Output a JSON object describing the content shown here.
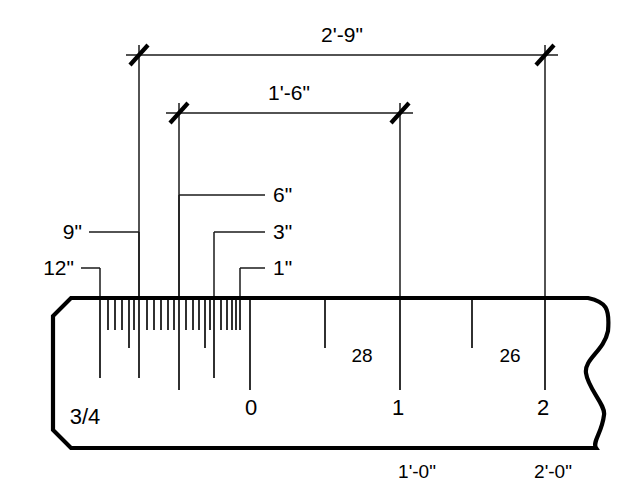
{
  "diagram": {
    "type": "architectural-scale-ruler",
    "scale_designation": "3/4",
    "dimensions": [
      {
        "id": "overall",
        "label": "2'-9\"",
        "x_start": 139,
        "x_end": 545,
        "y": 55,
        "text_x": 342,
        "text_y": 42
      },
      {
        "id": "inner",
        "label": "1'-6\"",
        "x_start": 179,
        "x_end": 400,
        "y": 113,
        "text_x": 289,
        "text_y": 100
      }
    ],
    "leaders": [
      {
        "id": "six-inch",
        "label": "6\"",
        "tick_x": 179,
        "elbow_y": 195,
        "text_x": 273,
        "text_y": 202,
        "side": "right",
        "run_end_x": 265
      },
      {
        "id": "three-inch",
        "label": "3\"",
        "tick_x": 214,
        "elbow_y": 232,
        "text_x": 273,
        "text_y": 239,
        "side": "right",
        "run_end_x": 265
      },
      {
        "id": "one-inch",
        "label": "1\"",
        "tick_x": 240,
        "elbow_y": 268,
        "text_x": 273,
        "text_y": 275,
        "side": "right",
        "run_end_x": 265
      },
      {
        "id": "nine-inch",
        "label": "9\"",
        "tick_x": 139,
        "elbow_y": 232,
        "text_x": 82,
        "text_y": 239,
        "side": "left",
        "run_end_x": 89
      },
      {
        "id": "twelve-inch",
        "label": "12\"",
        "tick_x": 100,
        "elbow_y": 268,
        "text_x": 74,
        "text_y": 275,
        "side": "left",
        "run_end_x": 81
      }
    ],
    "ruler": {
      "left_x": 53,
      "right_x": 610,
      "top_y": 298,
      "bottom_y": 448,
      "chamfer": 18
    },
    "graduations": [
      {
        "x": 100,
        "len": 78,
        "kind": "major"
      },
      {
        "x": 108,
        "len": 30,
        "kind": "minor"
      },
      {
        "x": 115,
        "len": 30,
        "kind": "minor"
      },
      {
        "x": 122,
        "len": 30,
        "kind": "minor"
      },
      {
        "x": 129,
        "len": 48,
        "kind": "medium"
      },
      {
        "x": 134,
        "len": 30,
        "kind": "minor"
      },
      {
        "x": 139,
        "len": 78,
        "kind": "major"
      },
      {
        "x": 147,
        "len": 30,
        "kind": "minor"
      },
      {
        "x": 154,
        "len": 30,
        "kind": "minor"
      },
      {
        "x": 161,
        "len": 30,
        "kind": "minor"
      },
      {
        "x": 168,
        "len": 30,
        "kind": "minor"
      },
      {
        "x": 174,
        "len": 30,
        "kind": "minor"
      },
      {
        "x": 179,
        "len": 90,
        "kind": "major"
      },
      {
        "x": 186,
        "len": 30,
        "kind": "minor"
      },
      {
        "x": 193,
        "len": 30,
        "kind": "minor"
      },
      {
        "x": 199,
        "len": 30,
        "kind": "minor"
      },
      {
        "x": 205,
        "len": 48,
        "kind": "medium"
      },
      {
        "x": 210,
        "len": 30,
        "kind": "minor"
      },
      {
        "x": 214,
        "len": 78,
        "kind": "major"
      },
      {
        "x": 221,
        "len": 30,
        "kind": "minor"
      },
      {
        "x": 227,
        "len": 30,
        "kind": "minor"
      },
      {
        "x": 232,
        "len": 30,
        "kind": "minor"
      },
      {
        "x": 236,
        "len": 30,
        "kind": "minor"
      },
      {
        "x": 240,
        "len": 30,
        "kind": "minor"
      },
      {
        "x": 250,
        "len": 90,
        "kind": "major"
      },
      {
        "x": 325,
        "len": 48,
        "kind": "medium"
      },
      {
        "x": 400,
        "len": 90,
        "kind": "major"
      },
      {
        "x": 472,
        "len": 48,
        "kind": "medium"
      },
      {
        "x": 545,
        "len": 90,
        "kind": "major"
      }
    ],
    "scale_labels": [
      {
        "text": "3/4",
        "x": 85,
        "y": 424,
        "size": "large"
      },
      {
        "text": "0",
        "x": 251,
        "y": 415,
        "size": "large"
      },
      {
        "text": "28",
        "x": 362,
        "y": 362,
        "size": "small"
      },
      {
        "text": "1",
        "x": 398,
        "y": 415,
        "size": "large"
      },
      {
        "text": "26",
        "x": 510,
        "y": 362,
        "size": "small"
      },
      {
        "text": "2",
        "x": 543,
        "y": 415,
        "size": "large"
      }
    ],
    "foot_labels": [
      {
        "text": "1'-0\"",
        "x": 417,
        "y": 478
      },
      {
        "text": "2'-0\"",
        "x": 553,
        "y": 478
      }
    ],
    "colors": {
      "ink": "#000000",
      "line": "#1a1a1a",
      "background": "#ffffff"
    }
  }
}
